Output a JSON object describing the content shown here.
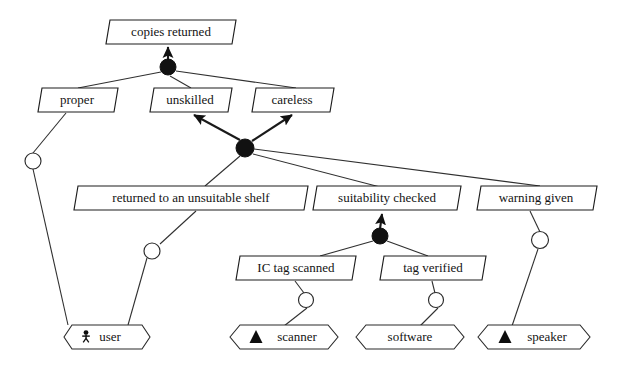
{
  "diagram": {
    "kind": "goal-refinement-diagram",
    "colors": {
      "background": "#ffffff",
      "stroke": "#1d1d1d",
      "text": "#141414",
      "and_node_fill": "#111111",
      "responsibility_circle_fill": "#ffffff"
    },
    "goals": [
      {
        "id": "copies-returned",
        "label": "copies returned",
        "cx": 168,
        "cy": 32,
        "w": 136,
        "h": 25
      },
      {
        "id": "proper",
        "label": "proper",
        "cx": 76,
        "cy": 100,
        "w": 82,
        "h": 25
      },
      {
        "id": "unskilled",
        "label": "unskilled",
        "cx": 191,
        "cy": 100,
        "w": 84,
        "h": 25
      },
      {
        "id": "careless",
        "label": "careless",
        "cx": 292,
        "cy": 100,
        "w": 82,
        "h": 25
      },
      {
        "id": "returned-to-an-unsuitable-shelf",
        "label": "returned to an unsuitable shelf",
        "cx": 192,
        "cy": 198,
        "w": 228,
        "h": 25
      },
      {
        "id": "suitability-checked",
        "label": "suitability checked",
        "cx": 386,
        "cy": 198,
        "w": 146,
        "h": 25
      },
      {
        "id": "warning-given",
        "label": "warning given",
        "cx": 536,
        "cy": 198,
        "w": 118,
        "h": 25
      },
      {
        "id": "ic-tag-scanned",
        "label": "IC tag scanned",
        "cx": 295,
        "cy": 268,
        "w": 118,
        "h": 25
      },
      {
        "id": "tag-verified",
        "label": "tag verified",
        "cx": 432,
        "cy": 268,
        "w": 104,
        "h": 25
      }
    ],
    "agents": [
      {
        "id": "user",
        "label": "user",
        "icon": "stick-figure-icon",
        "cx": 100,
        "cy": 337,
        "w": 92,
        "h": 26
      },
      {
        "id": "scanner",
        "label": "scanner",
        "icon": "triangle-icon",
        "cx": 284,
        "cy": 337,
        "w": 108,
        "h": 26
      },
      {
        "id": "software",
        "label": "software",
        "icon": "none",
        "cx": 410,
        "cy": 337,
        "w": 108,
        "h": 26
      },
      {
        "id": "speaker",
        "label": "speaker",
        "icon": "triangle-icon",
        "cx": 534,
        "cy": 337,
        "w": 112,
        "h": 26
      }
    ],
    "and_nodes": [
      {
        "id": "and-1",
        "cx": 168,
        "cy": 67,
        "r": 8,
        "refines": "copies-returned",
        "from": [
          "proper",
          "unskilled",
          "careless"
        ]
      },
      {
        "id": "and-2",
        "cx": 245,
        "cy": 148,
        "r": 9,
        "refines_to": [
          "unskilled",
          "careless"
        ],
        "from": [
          "returned-to-an-unsuitable-shelf",
          "suitability-checked",
          "warning-given"
        ]
      },
      {
        "id": "and-3",
        "cx": 380,
        "cy": 236,
        "r": 8,
        "refines": "suitability-checked",
        "from": [
          "ic-tag-scanned",
          "tag-verified"
        ]
      }
    ],
    "responsibility_links": [
      {
        "id": "resp-proper-user",
        "goal": "proper",
        "agent": "user",
        "circle_cx": 33,
        "circle_cy": 161,
        "circle_r": 8
      },
      {
        "id": "resp-shelf-user",
        "goal": "returned-to-an-unsuitable-shelf",
        "agent": "user",
        "circle_cx": 152,
        "circle_cy": 251,
        "circle_r": 8
      },
      {
        "id": "resp-ictag-scanner",
        "goal": "ic-tag-scanned",
        "agent": "scanner",
        "circle_cx": 306,
        "circle_cy": 300,
        "circle_r": 7.5
      },
      {
        "id": "resp-tagver-software",
        "goal": "tag-verified",
        "agent": "software",
        "circle_cx": 436,
        "circle_cy": 300,
        "circle_r": 7.5
      },
      {
        "id": "resp-warning-speaker",
        "goal": "warning-given",
        "agent": "speaker",
        "circle_cx": 540,
        "circle_cy": 240,
        "circle_r": 8.5
      }
    ]
  }
}
